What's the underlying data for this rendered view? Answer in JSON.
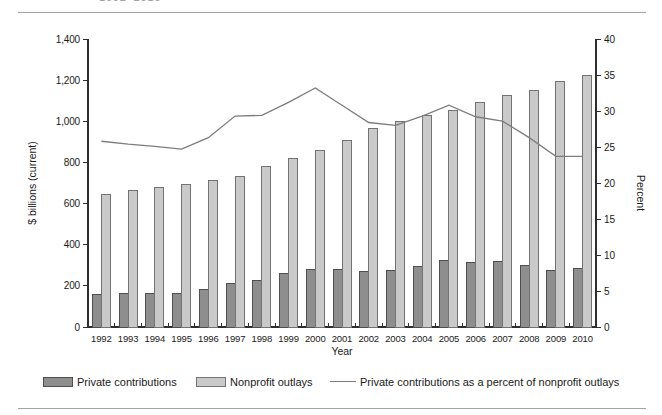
{
  "page": {
    "title_fragment": "1992–2010"
  },
  "chart": {
    "ylabel_left": "$ billions (current)",
    "ylabel_right": "Percent",
    "xlabel": "Year",
    "left_axis_ticks": [
      "0",
      "200",
      "400",
      "600",
      "800",
      "1,000",
      "1,200",
      "1,400"
    ],
    "right_axis_ticks": [
      "0",
      "5",
      "10",
      "15",
      "20",
      "25",
      "30",
      "35",
      "40"
    ]
  },
  "legend": [
    {
      "label": "Private contributions",
      "swatch": "dark-bar",
      "color": "#8e8e8e"
    },
    {
      "label": "Nonprofit outlays",
      "swatch": "light-bar",
      "color": "#c9c9c9"
    },
    {
      "label": "Private contributions as a percent of nonprofit outlays",
      "swatch": "line",
      "color": "#7d7d7d"
    }
  ],
  "colors": {
    "bar_dark_fill": "#8e8e8e",
    "bar_dark_stroke": "#4f4f4f",
    "bar_light_fill": "#c9c9c9",
    "bar_light_stroke": "#737373",
    "line": "#7d7d7d",
    "axis": "#2e2e2e",
    "rule": "#a3a3a3"
  },
  "chart_data": {
    "type": "bar",
    "subtype": "grouped-bars-with-line",
    "categories": [
      1992,
      1993,
      1994,
      1995,
      1996,
      1997,
      1998,
      1999,
      2000,
      2001,
      2002,
      2003,
      2004,
      2005,
      2006,
      2007,
      2008,
      2009,
      2010
    ],
    "series": [
      {
        "name": "Private contributions",
        "type": "bar",
        "axis": "left",
        "values": [
          160,
          163,
          165,
          165,
          182,
          212,
          228,
          258,
          280,
          278,
          272,
          274,
          294,
          322,
          314,
          320,
          298,
          277,
          286
        ]
      },
      {
        "name": "Nonprofit outlays",
        "type": "bar",
        "axis": "left",
        "values": [
          645,
          665,
          680,
          692,
          714,
          730,
          781,
          819,
          856,
          908,
          966,
          998,
          1029,
          1053,
          1090,
          1123,
          1151,
          1193,
          1224
        ]
      },
      {
        "name": "Private contributions as a percent of nonprofit outlays",
        "type": "line",
        "axis": "right",
        "values": [
          25.8,
          25.4,
          25.1,
          24.7,
          26.3,
          29.3,
          29.4,
          31.2,
          33.2,
          30.8,
          28.4,
          28.0,
          29.3,
          30.8,
          29.2,
          28.6,
          26.3,
          23.7,
          23.7
        ]
      }
    ],
    "title": "",
    "xlabel": "Year",
    "left_axis": {
      "label": "$ billions (current)",
      "min": 0,
      "max": 1400,
      "step": 200
    },
    "right_axis": {
      "label": "Percent",
      "min": 0,
      "max": 40,
      "step": 5
    },
    "grid": false,
    "legend_position": "bottom"
  }
}
